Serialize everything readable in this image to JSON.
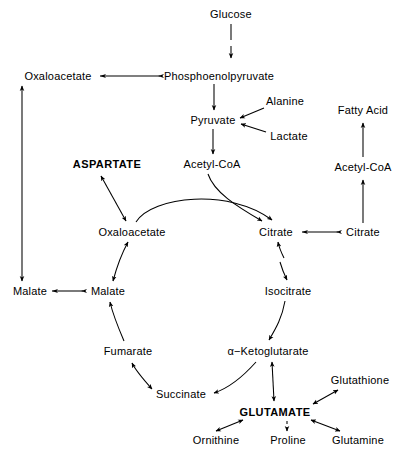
{
  "diagram": {
    "width": 414,
    "height": 456,
    "stroke_color": "#000000",
    "background_color": "#ffffff",
    "nodes": [
      {
        "id": "glucose",
        "label": "Glucose",
        "x": 231,
        "y": 14,
        "bold": false
      },
      {
        "id": "oxaloacetate_out",
        "label": "Oxaloacetate",
        "x": 58,
        "y": 76,
        "bold": false
      },
      {
        "id": "pep",
        "label": "Phosphoenolpyruvate",
        "x": 219,
        "y": 76,
        "bold": false
      },
      {
        "id": "alanine",
        "label": "Alanine",
        "x": 285,
        "y": 101,
        "bold": false
      },
      {
        "id": "fatty_acid",
        "label": "Fatty Acid",
        "x": 363,
        "y": 110,
        "bold": false
      },
      {
        "id": "pyruvate",
        "label": "Pyruvate",
        "x": 213,
        "y": 120,
        "bold": false
      },
      {
        "id": "lactate",
        "label": "Lactate",
        "x": 289,
        "y": 136,
        "bold": false
      },
      {
        "id": "aspartate",
        "label": "ASPARTATE",
        "x": 107,
        "y": 164,
        "bold": true
      },
      {
        "id": "acetyl_coa_mito",
        "label": "Acetyl-CoA",
        "x": 212,
        "y": 164,
        "bold": false
      },
      {
        "id": "acetyl_coa_cyto",
        "label": "Acetyl-CoA",
        "x": 363,
        "y": 167,
        "bold": false
      },
      {
        "id": "oxaloacetate_in",
        "label": "Oxaloacetate",
        "x": 132,
        "y": 232,
        "bold": false
      },
      {
        "id": "citrate_in",
        "label": "Citrate",
        "x": 276,
        "y": 232,
        "bold": false
      },
      {
        "id": "citrate_out",
        "label": "Citrate",
        "x": 363,
        "y": 232,
        "bold": false
      },
      {
        "id": "malate_out",
        "label": "Malate",
        "x": 30,
        "y": 291,
        "bold": false
      },
      {
        "id": "malate_in",
        "label": "Malate",
        "x": 108,
        "y": 291,
        "bold": false
      },
      {
        "id": "isocitrate",
        "label": "Isocitrate",
        "x": 288,
        "y": 291,
        "bold": false
      },
      {
        "id": "fumarate",
        "label": "Fumarate",
        "x": 128,
        "y": 351,
        "bold": false
      },
      {
        "id": "ketoglutarate",
        "label": "α−Ketoglutarate",
        "x": 268,
        "y": 351,
        "bold": false
      },
      {
        "id": "glutathione",
        "label": "Glutathione",
        "x": 360,
        "y": 380,
        "bold": false
      },
      {
        "id": "succinate",
        "label": "Succinate",
        "x": 181,
        "y": 394,
        "bold": false
      },
      {
        "id": "glutamate",
        "label": "GLUTAMATE",
        "x": 275,
        "y": 412,
        "bold": true
      },
      {
        "id": "ornithine",
        "label": "Ornithine",
        "x": 216,
        "y": 440,
        "bold": false
      },
      {
        "id": "proline",
        "label": "Proline",
        "x": 288,
        "y": 440,
        "bold": false
      },
      {
        "id": "glutamine",
        "label": "Glutamine",
        "x": 358,
        "y": 440,
        "bold": false
      }
    ],
    "edges": [
      {
        "id": "glucose-to-pep",
        "from": "glucose",
        "to": "pep",
        "style": "dashed",
        "direction": "one-way"
      },
      {
        "id": "pep-to-oxaloacetate-out",
        "from": "pep",
        "to": "oxaloacetate_out",
        "style": "solid",
        "direction": "one-way"
      },
      {
        "id": "pep-to-pyruvate",
        "from": "pep",
        "to": "pyruvate",
        "style": "solid",
        "direction": "one-way"
      },
      {
        "id": "alanine-to-pyruvate",
        "from": "alanine",
        "to": "pyruvate",
        "style": "solid",
        "direction": "one-way"
      },
      {
        "id": "lactate-to-pyruvate",
        "from": "lactate",
        "to": "pyruvate",
        "style": "solid",
        "direction": "one-way"
      },
      {
        "id": "pyruvate-to-acetyl-coa",
        "from": "pyruvate",
        "to": "acetyl_coa_mito",
        "style": "solid",
        "direction": "one-way"
      },
      {
        "id": "oxaloacetate-out-to-malate-out",
        "from": "oxaloacetate_out",
        "to": "malate_out",
        "style": "solid",
        "direction": "two-way"
      },
      {
        "id": "malate-in-to-malate-out",
        "from": "malate_in",
        "to": "malate_out",
        "style": "solid",
        "direction": "one-way"
      },
      {
        "id": "aspartate-oxaloacetate-in",
        "from": "aspartate",
        "to": "oxaloacetate_in",
        "style": "solid",
        "direction": "two-way"
      },
      {
        "id": "acetyl-coa-to-citrate",
        "from": "acetyl_coa_mito",
        "to": "citrate_in",
        "style": "solid",
        "direction": "one-way"
      },
      {
        "id": "oxaloacetate-in-to-citrate",
        "from": "oxaloacetate_in",
        "to": "citrate_in",
        "style": "solid",
        "direction": "one-way"
      },
      {
        "id": "citrate-out-to-citrate-in",
        "from": "citrate_out",
        "to": "citrate_in",
        "style": "solid",
        "direction": "one-way"
      },
      {
        "id": "citrate-out-to-acetyl-coa",
        "from": "citrate_out",
        "to": "acetyl_coa_cyto",
        "style": "solid",
        "direction": "one-way"
      },
      {
        "id": "acetyl-coa-to-fatty-acid",
        "from": "acetyl_coa_cyto",
        "to": "fatty_acid",
        "style": "solid",
        "direction": "one-way"
      },
      {
        "id": "citrate-isocitrate",
        "from": "citrate_in",
        "to": "isocitrate",
        "style": "dashed",
        "direction": "two-way"
      },
      {
        "id": "isocitrate-to-ketoglutarate",
        "from": "isocitrate",
        "to": "ketoglutarate",
        "style": "solid",
        "direction": "one-way"
      },
      {
        "id": "ketoglutarate-to-succinate",
        "from": "ketoglutarate",
        "to": "succinate",
        "style": "solid",
        "direction": "one-way"
      },
      {
        "id": "succinate-fumarate",
        "from": "succinate",
        "to": "fumarate",
        "style": "solid",
        "direction": "two-way"
      },
      {
        "id": "fumarate-to-malate-in",
        "from": "fumarate",
        "to": "malate_in",
        "style": "solid",
        "direction": "one-way"
      },
      {
        "id": "malate-in-to-oxaloacetate-in",
        "from": "malate_in",
        "to": "oxaloacetate_in",
        "style": "solid",
        "direction": "two-way"
      },
      {
        "id": "ketoglutarate-glutamate",
        "from": "ketoglutarate",
        "to": "glutamate",
        "style": "solid",
        "direction": "two-way"
      },
      {
        "id": "glutathione-glutamate",
        "from": "glutathione",
        "to": "glutamate",
        "style": "solid",
        "direction": "two-way"
      },
      {
        "id": "glutamate-ornithine",
        "from": "glutamate",
        "to": "ornithine",
        "style": "solid",
        "direction": "two-way"
      },
      {
        "id": "glutamate-proline",
        "from": "glutamate",
        "to": "proline",
        "style": "dashed",
        "direction": "two-way"
      },
      {
        "id": "glutamate-glutamine",
        "from": "glutamate",
        "to": "glutamine",
        "style": "solid",
        "direction": "two-way"
      }
    ]
  }
}
